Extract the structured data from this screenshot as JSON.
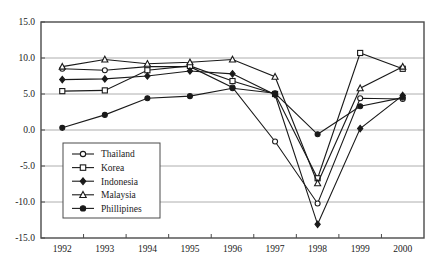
{
  "chart_data": {
    "type": "line",
    "title": "",
    "xlabel": "",
    "ylabel": "",
    "categories": [
      "1992",
      "1993",
      "1994",
      "1995",
      "1996",
      "1997",
      "1998",
      "1999",
      "2000"
    ],
    "x": [
      1992,
      1993,
      1994,
      1995,
      1996,
      1997,
      1998,
      1999,
      2000
    ],
    "ylim": [
      -15.0,
      15.0
    ],
    "yticks": [
      "15.0",
      "10.0",
      "5.0",
      "0.0",
      "-5.0",
      "-10.0",
      "-15.0"
    ],
    "ytick_values": [
      15.0,
      10.0,
      5.0,
      0.0,
      -5.0,
      -10.0,
      -15.0
    ],
    "grid": true,
    "legend_position": "lower-left-inside",
    "series": [
      {
        "name": "Thailand",
        "marker": "open-circle",
        "values": [
          8.5,
          8.3,
          8.8,
          8.8,
          5.9,
          -1.6,
          -10.2,
          4.4,
          4.3
        ]
      },
      {
        "name": "Korea",
        "marker": "open-square",
        "values": [
          5.4,
          5.5,
          8.3,
          8.9,
          6.8,
          5.0,
          -6.7,
          10.7,
          8.5
        ]
      },
      {
        "name": "Indonesia",
        "marker": "filled-diamond",
        "values": [
          7.0,
          7.1,
          7.5,
          8.2,
          7.8,
          4.9,
          -13.1,
          0.2,
          4.8
        ]
      },
      {
        "name": "Malaysia",
        "marker": "open-triangle",
        "values": [
          8.8,
          9.8,
          9.2,
          9.4,
          9.8,
          7.4,
          -7.4,
          5.8,
          8.8
        ]
      },
      {
        "name": "Phillipines",
        "marker": "filled-circle",
        "values": [
          0.3,
          2.1,
          4.4,
          4.7,
          5.8,
          5.1,
          -0.6,
          3.3,
          4.5
        ]
      }
    ]
  },
  "axes": {
    "x_tick_labels": [
      "1992",
      "1993",
      "1994",
      "1995",
      "1996",
      "1997",
      "1998",
      "1999",
      "2000"
    ],
    "y_tick_labels": [
      "15.0",
      "10.0",
      "5.0",
      "0.0",
      "-5.0",
      "-10.0",
      "-15.0"
    ]
  },
  "legend": {
    "entries": [
      {
        "label": "Thailand",
        "marker": "open-circle"
      },
      {
        "label": "Korea",
        "marker": "open-square"
      },
      {
        "label": "Indonesia",
        "marker": "filled-diamond"
      },
      {
        "label": "Malaysia",
        "marker": "open-triangle"
      },
      {
        "label": "Phillipines",
        "marker": "filled-circle"
      }
    ]
  },
  "caption": {
    "text": ""
  },
  "colors": {
    "line": "#1a1a1a",
    "grid": "#9a9a9a",
    "axis": "#4a4a4a",
    "background": "#ffffff",
    "marker_fill_open": "#ffffff",
    "marker_fill_solid": "#1a1a1a"
  }
}
